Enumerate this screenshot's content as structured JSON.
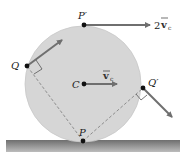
{
  "diagram": {
    "type": "rolling-wheel-velocity",
    "colors": {
      "disk_fill": "#d6d6d6",
      "disk_stroke": "#c4c4c4",
      "arrow": "#6f6f6f",
      "point": "#111111",
      "dash": "#7a7a7a",
      "ground_top": "#6e6e6e",
      "ground_bottom": "#b8b8b8"
    },
    "labels": {
      "top_point": "P′",
      "contact_point": "P",
      "center": "C",
      "left_point": "Q",
      "right_point": "Q′",
      "center_velocity": "v",
      "center_velocity_sub": "c",
      "top_velocity_coef": "2",
      "top_velocity": "v",
      "top_velocity_sub": "c"
    }
  }
}
